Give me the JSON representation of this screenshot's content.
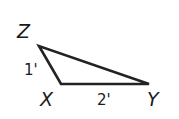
{
  "diagram": {
    "type": "triangle",
    "vertices": [
      {
        "name": "Z",
        "label": "Z"
      },
      {
        "name": "X",
        "label": "X"
      },
      {
        "name": "Y",
        "label": "Y"
      }
    ],
    "sides": [
      {
        "between": "ZX",
        "label": "1'"
      },
      {
        "between": "XY",
        "label": "2'"
      }
    ],
    "stroke_color": "#222222"
  }
}
